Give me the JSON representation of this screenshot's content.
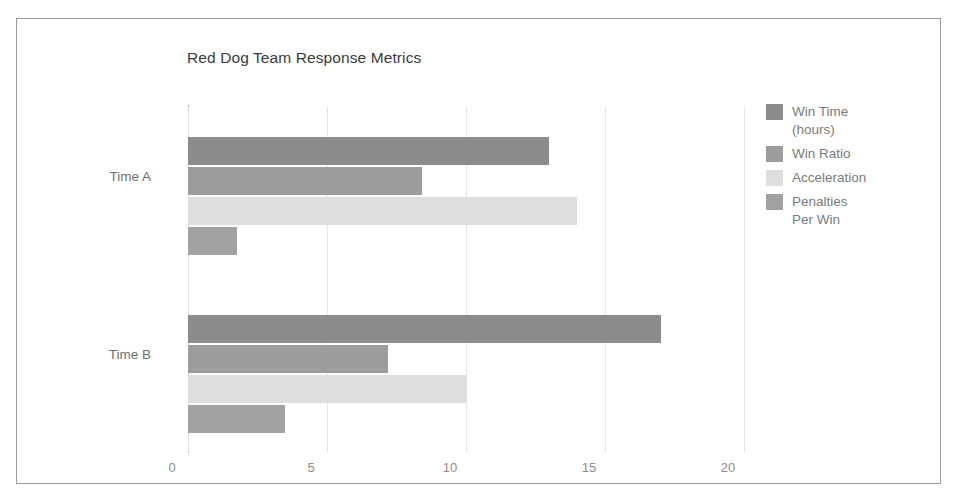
{
  "chart_data": {
    "type": "bar",
    "orientation": "horizontal",
    "title": "Red Dog Team Response Metrics",
    "xlabel": "",
    "ylabel": "",
    "categories": [
      "Time A",
      "Time B"
    ],
    "xlim": [
      0,
      20
    ],
    "xticks": [
      0,
      5,
      10,
      15,
      20
    ],
    "xtick_labels": [
      "0",
      "5",
      "10",
      "15",
      "20"
    ],
    "grid": true,
    "grid_axis": "x",
    "legend_position": "right",
    "series": [
      {
        "name": "Win Time (hours)",
        "legend_label": "Win Time\n(hours)",
        "color": "#8c8c8c",
        "values": [
          13,
          17
        ]
      },
      {
        "name": "Win Ratio",
        "legend_label": "Win Ratio",
        "color": "#9d9d9d",
        "values": [
          8.4,
          7.2
        ]
      },
      {
        "name": "Acceleration",
        "legend_label": "Acceleration",
        "color": "#dedede",
        "values": [
          14,
          10
        ]
      },
      {
        "name": "Penalties Per Win",
        "legend_label": "Penalties\nPer Win",
        "color": "#a2a2a2",
        "values": [
          1.75,
          3.5
        ]
      }
    ]
  },
  "colors": {
    "frame_border": "#9b9b9b",
    "axis_line": "#a8a8a8",
    "gridline": "#e3e3e3",
    "title_text": "#3b3b3b",
    "tick_text": "#8d8d8d",
    "category_text": "#6f6f6f",
    "legend_text": "#7b7b7b",
    "background": "#ffffff"
  }
}
